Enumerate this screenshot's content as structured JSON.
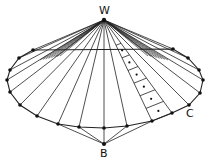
{
  "diagram": {
    "title": "",
    "labels": {
      "apex": "W",
      "bottom": "B",
      "corner": "C"
    },
    "colors": {
      "stroke": "#222222",
      "node": "#111111",
      "background": "#ffffff"
    },
    "apex": [
      104,
      20
    ],
    "bottom_node": [
      104,
      144
    ],
    "boundary_nodes": [
      [
        33,
        50
      ],
      [
        19,
        58
      ],
      [
        10,
        70
      ],
      [
        7,
        80
      ],
      [
        10,
        92
      ],
      [
        20,
        105
      ],
      [
        37,
        116
      ],
      [
        58,
        124
      ],
      [
        79,
        127
      ],
      [
        104,
        128
      ],
      [
        127,
        126
      ],
      [
        152,
        121
      ],
      [
        172,
        113
      ],
      [
        189,
        105
      ],
      [
        200,
        93
      ],
      [
        203,
        80
      ],
      [
        199,
        70
      ],
      [
        188,
        58
      ],
      [
        173,
        49
      ]
    ],
    "bottom_connections": [
      [
        79,
        127
      ],
      [
        104,
        128
      ],
      [
        127,
        126
      ]
    ],
    "bottom_outer_connections": [
      [
        58,
        124
      ],
      [
        152,
        121
      ]
    ],
    "cell_strip": {
      "count": 6,
      "inner_ray_end": [
        152,
        121
      ],
      "outer_ray_end": [
        172,
        113
      ]
    }
  }
}
